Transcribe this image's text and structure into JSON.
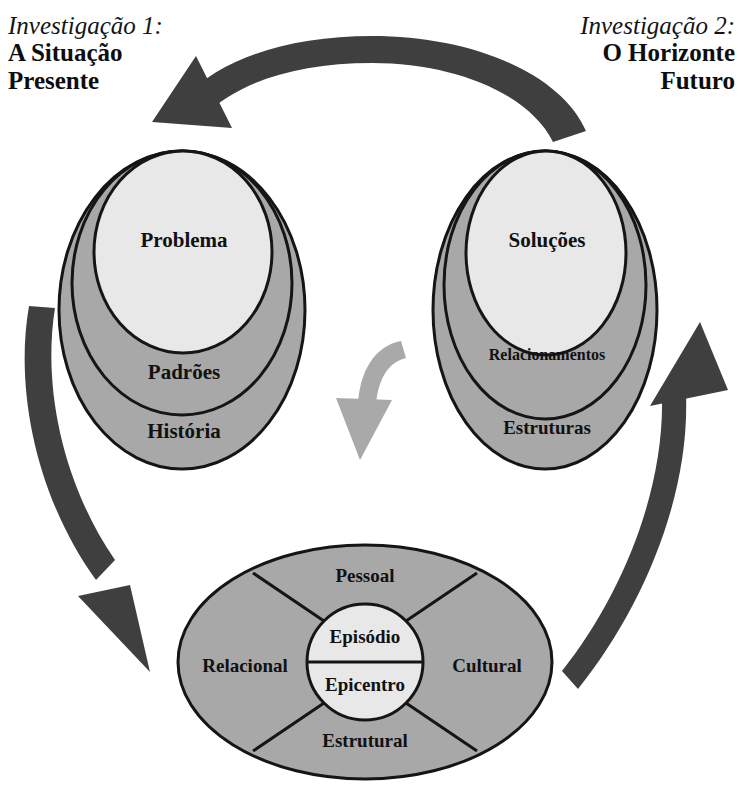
{
  "headers": {
    "left": {
      "kicker": "Investigação 1:",
      "line1": "A Situação",
      "line2": "Presente"
    },
    "right": {
      "kicker": "Investigação 2:",
      "line1": "O Horizonte",
      "line2": "Futuro"
    }
  },
  "left_egg": {
    "name": "A Situação Presente",
    "layers": [
      {
        "label": "História",
        "level": "outer"
      },
      {
        "label": "Padrões",
        "level": "middle"
      },
      {
        "label": "Problema",
        "level": "inner"
      }
    ]
  },
  "right_egg": {
    "name": "O Horizonte Futuro",
    "layers": [
      {
        "label": "Estruturas",
        "level": "outer"
      },
      {
        "label": "Relacionamentos",
        "level": "middle"
      },
      {
        "label": "Soluções",
        "level": "inner"
      }
    ]
  },
  "bottom_ellipse": {
    "name": "Epicentro",
    "segments": [
      {
        "label": "Pessoal",
        "position": "top"
      },
      {
        "label": "Cultural",
        "position": "right"
      },
      {
        "label": "Estrutural",
        "position": "bottom"
      },
      {
        "label": "Relacional",
        "position": "left"
      }
    ],
    "core": {
      "top_label": "Episódio",
      "bottom_label": "Epicentro"
    }
  },
  "arrows": [
    {
      "id": "top-arrow",
      "from": "right-egg",
      "to": "left-egg",
      "direction": "right-to-left",
      "style": "dark"
    },
    {
      "id": "left-arrow",
      "from": "left-egg",
      "to": "bottom-ellipse",
      "direction": "down-right",
      "style": "dark"
    },
    {
      "id": "right-arrow",
      "from": "bottom-ellipse",
      "to": "right-egg",
      "direction": "up-right",
      "style": "dark"
    },
    {
      "id": "center-arrow",
      "from": "between-eggs",
      "to": "bottom-ellipse",
      "direction": "down",
      "style": "light"
    }
  ],
  "colors": {
    "shape_gray": "#a8a8a8",
    "shape_light": "#e8e8e8",
    "outline": "#151515",
    "arrow_dark": "#3f3f3f",
    "arrow_light": "#a9a9a9",
    "text": "#111111",
    "background": "#ffffff"
  }
}
